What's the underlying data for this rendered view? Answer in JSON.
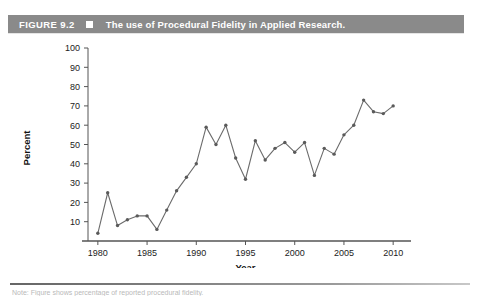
{
  "figure": {
    "label": "FIGURE 9.2",
    "marker_icon": "filled-square-icon",
    "title": "The use of Procedural Fidelity in Applied Research.",
    "bar_color": "#8a8a8a",
    "text_color": "#ffffff"
  },
  "footer": {
    "note": "Note: Figure shows percentage of reported procedural fidelity."
  },
  "chart_data": {
    "type": "line",
    "title": "The use of Procedural Fidelity in Applied Research.",
    "xlabel": "Year",
    "ylabel": "Percent",
    "xlim": [
      1979,
      2011
    ],
    "ylim": [
      0,
      100
    ],
    "grid": false,
    "legend": "none",
    "line_color": "#6b6b6b",
    "marker": "circle",
    "xticks": [
      1980,
      1985,
      1990,
      1995,
      2000,
      2005,
      2010
    ],
    "yticks": [
      10,
      20,
      30,
      40,
      50,
      60,
      70,
      80,
      90,
      100
    ],
    "x": [
      1980,
      1981,
      1982,
      1983,
      1984,
      1985,
      1986,
      1987,
      1988,
      1989,
      1990,
      1991,
      1992,
      1993,
      1994,
      1995,
      1996,
      1997,
      1998,
      1999,
      2000,
      2001,
      2002,
      2003,
      2004,
      2005,
      2006,
      2007,
      2008,
      2009,
      2010
    ],
    "values": [
      4,
      25,
      8,
      11,
      13,
      13,
      6,
      16,
      26,
      33,
      40,
      59,
      50,
      60,
      43,
      32,
      52,
      42,
      48,
      51,
      46,
      51,
      34,
      48,
      45,
      55,
      60,
      73,
      67,
      66,
      70
    ],
    "series": [
      {
        "name": "Percent reporting procedural fidelity",
        "values": [
          4,
          25,
          8,
          11,
          13,
          13,
          6,
          16,
          26,
          33,
          40,
          59,
          50,
          60,
          43,
          32,
          52,
          42,
          48,
          51,
          46,
          51,
          34,
          48,
          45,
          55,
          60,
          73,
          67,
          66,
          70
        ]
      }
    ]
  }
}
